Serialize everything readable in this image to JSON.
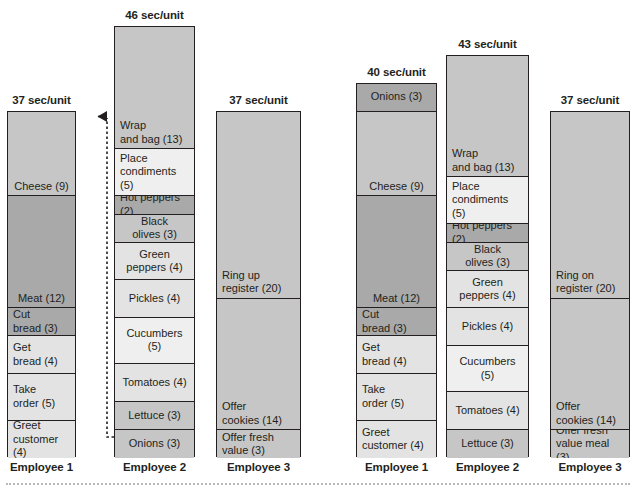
{
  "chart_data": {
    "type": "bar",
    "title": "",
    "subtitle": "",
    "xlabel": "",
    "ylabel": "",
    "unit_label": "sec/unit",
    "note": "Two stacked operator-balance bar charts (before / after rebalance). Each bar is one employee; each stacked segment is a task with its duration in seconds shown in parentheses. Bar header shows the employee's total cycle time.",
    "colors": {
      "dark_gray": "#a9a9a9",
      "medium_gray": "#c6c6c6",
      "light_gray": "#e3e3e3",
      "lightest_gray": "#efefef",
      "outline": "#231f20",
      "connector": "#231f20",
      "bottom_rule": "#b9b9b9"
    },
    "charts": [
      {
        "name": "before",
        "bars": [
          {
            "employee": "Employee 1",
            "total_label": "37 sec/unit",
            "total": 37,
            "segments": [
              {
                "label": "Cheese (9)",
                "value": 9,
                "shade": "medium_gray",
                "align": "center"
              },
              {
                "label": "Meat (12)",
                "value": 12,
                "shade": "dark_gray",
                "align": "center"
              },
              {
                "label": "Cut\nbread (3)",
                "value": 3,
                "shade": "dark_gray",
                "align": "left"
              },
              {
                "label": "Get\nbread (4)",
                "value": 4,
                "shade": "light_gray",
                "align": "left"
              },
              {
                "label": "Take\norder (5)",
                "value": 5,
                "shade": "light_gray",
                "align": "left"
              },
              {
                "label": "Greet\ncustomer (4)",
                "value": 4,
                "shade": "light_gray",
                "align": "left"
              }
            ]
          },
          {
            "employee": "Employee 2",
            "total_label": "46 sec/unit",
            "total": 46,
            "segments": [
              {
                "label": "Wrap\nand bag (13)",
                "value": 13,
                "shade": "medium_gray",
                "align": "left"
              },
              {
                "label": "Place\ncondiments (5)",
                "value": 5,
                "shade": "lightest_gray",
                "align": "left"
              },
              {
                "label": "Hot peppers (2)",
                "value": 2,
                "shade": "dark_gray",
                "align": "left"
              },
              {
                "label": "Black\nolives (3)",
                "value": 3,
                "shade": "medium_gray",
                "align": "center"
              },
              {
                "label": "Green\npeppers (4)",
                "value": 4,
                "shade": "light_gray",
                "align": "center"
              },
              {
                "label": "Pickles (4)",
                "value": 4,
                "shade": "light_gray",
                "align": "center"
              },
              {
                "label": "Cucumbers (5)",
                "value": 5,
                "shade": "lightest_gray",
                "align": "center"
              },
              {
                "label": "Tomatoes (4)",
                "value": 4,
                "shade": "light_gray",
                "align": "center"
              },
              {
                "label": "Lettuce (3)",
                "value": 3,
                "shade": "medium_gray",
                "align": "center"
              },
              {
                "label": "Onions (3)",
                "value": 3,
                "shade": "medium_gray",
                "align": "center"
              }
            ]
          },
          {
            "employee": "Employee 3",
            "total_label": "37 sec/unit",
            "total": 37,
            "segments": [
              {
                "label": "Ring up\nregister (20)",
                "value": 20,
                "shade": "medium_gray",
                "align": "left"
              },
              {
                "label": "Offer\ncookies (14)",
                "value": 14,
                "shade": "medium_gray",
                "align": "left"
              },
              {
                "label": "Offer fresh\nvalue (3)",
                "value": 3,
                "shade": "medium_gray",
                "align": "left"
              }
            ]
          }
        ]
      },
      {
        "name": "after",
        "bars": [
          {
            "employee": "Employee 1",
            "total_label": "40 sec/unit",
            "total": 40,
            "segments": [
              {
                "label": "Onions (3)",
                "value": 3,
                "shade": "dark_gray",
                "align": "center"
              },
              {
                "label": "Cheese (9)",
                "value": 9,
                "shade": "medium_gray",
                "align": "center"
              },
              {
                "label": "Meat (12)",
                "value": 12,
                "shade": "dark_gray",
                "align": "center"
              },
              {
                "label": "Cut\nbread (3)",
                "value": 3,
                "shade": "dark_gray",
                "align": "left"
              },
              {
                "label": "Get\nbread (4)",
                "value": 4,
                "shade": "light_gray",
                "align": "left"
              },
              {
                "label": "Take\norder (5)",
                "value": 5,
                "shade": "light_gray",
                "align": "left"
              },
              {
                "label": "Greet\ncustomer (4)",
                "value": 4,
                "shade": "light_gray",
                "align": "left"
              }
            ]
          },
          {
            "employee": "Employee 2",
            "total_label": "43 sec/unit",
            "total": 43,
            "segments": [
              {
                "label": "Wrap\nand bag (13)",
                "value": 13,
                "shade": "medium_gray",
                "align": "left"
              },
              {
                "label": "Place\ncondiments (5)",
                "value": 5,
                "shade": "lightest_gray",
                "align": "left"
              },
              {
                "label": "Hot peppers (2)",
                "value": 2,
                "shade": "dark_gray",
                "align": "left"
              },
              {
                "label": "Black\nolives (3)",
                "value": 3,
                "shade": "medium_gray",
                "align": "center"
              },
              {
                "label": "Green\npeppers (4)",
                "value": 4,
                "shade": "light_gray",
                "align": "center"
              },
              {
                "label": "Pickles (4)",
                "value": 4,
                "shade": "light_gray",
                "align": "center"
              },
              {
                "label": "Cucumbers (5)",
                "value": 5,
                "shade": "lightest_gray",
                "align": "center"
              },
              {
                "label": "Tomatoes (4)",
                "value": 4,
                "shade": "light_gray",
                "align": "center"
              },
              {
                "label": "Lettuce (3)",
                "value": 3,
                "shade": "medium_gray",
                "align": "center"
              }
            ]
          },
          {
            "employee": "Employee 3",
            "total_label": "37 sec/unit",
            "total": 37,
            "segments": [
              {
                "label": "Ring on\nregister (20)",
                "value": 20,
                "shade": "medium_gray",
                "align": "left"
              },
              {
                "label": "Offer\ncookies (14)",
                "value": 14,
                "shade": "medium_gray",
                "align": "left"
              },
              {
                "label": "Offer fresh\nvalue meal (3)",
                "value": 3,
                "shade": "medium_gray",
                "align": "left"
              }
            ]
          }
        ]
      }
    ],
    "annotations": [
      {
        "type": "arrow",
        "name": "reassign-onions-arrow",
        "style": "dotted-elbow-up-arrow",
        "from": "Employee 2 Onions (3)",
        "to": "Employee 1 top"
      }
    ]
  }
}
